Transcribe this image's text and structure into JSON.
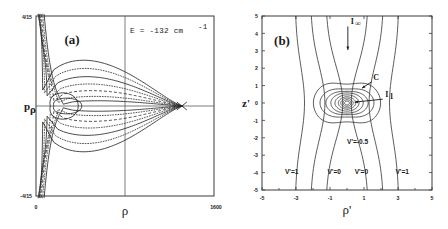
{
  "figure": {
    "caption_panels": [
      "(a)",
      "(b)"
    ],
    "background_color": "#ffffff",
    "line_color": "#2b2b2b"
  },
  "panel_a": {
    "label": "(a)",
    "annotation": {
      "text_main": "E  =  -132  cm",
      "exponent": "-1",
      "full": "E = -132 cm^-1"
    },
    "ylabel": "p",
    "ylabel_sub": "ρ",
    "xlabel": "ρ",
    "y_ticks": [
      {
        "value": 0.26667,
        "label": "4/15"
      },
      {
        "value": -0.26667,
        "label": "-4/15"
      }
    ],
    "x_ticks": [
      {
        "value": 0,
        "label": "0"
      },
      {
        "value": 1600,
        "label": "1600"
      }
    ],
    "xlim": [
      0,
      1600
    ],
    "ylim": [
      -0.26667,
      0.26667
    ],
    "crosshair": {
      "x": 800,
      "y": 0
    },
    "focus_point": {
      "x": 1320,
      "y": 0
    }
  },
  "panel_b": {
    "label": "(b)",
    "ylabel": "z'",
    "xlabel": "ρ'",
    "y_ticks": [
      5,
      4,
      3,
      2,
      1,
      0,
      -1,
      -2,
      -3,
      -4,
      -5
    ],
    "x_ticks": [
      -5,
      -3,
      -1,
      1,
      3,
      5
    ],
    "x_minor_ticks": [
      -4,
      -2,
      0,
      2,
      4
    ],
    "xlim": [
      -5,
      5
    ],
    "ylim": [
      -5,
      5
    ],
    "annotations": [
      {
        "name": "I-infinity",
        "text": "I",
        "sub": "∞",
        "x": 0.22,
        "y": 4.55
      },
      {
        "name": "contour-C",
        "text": "C",
        "sub": "",
        "x": 1.55,
        "y": 1.35
      },
      {
        "name": "I-one",
        "text": "I",
        "sub": "1",
        "x": 2.25,
        "y": 0.35
      },
      {
        "name": "potential-minus-half",
        "text": "V'=-0.5",
        "sub": "",
        "x": 0.0,
        "y": -2.35
      },
      {
        "name": "potential-left-one",
        "text": "V'=1",
        "sub": "",
        "x": -3.65,
        "y": -4.1
      },
      {
        "name": "potential-left-zero",
        "text": "V'=0",
        "sub": "",
        "x": -1.15,
        "y": -4.1
      },
      {
        "name": "potential-right-zero",
        "text": "V'=0",
        "sub": "",
        "x": 0.45,
        "y": -4.1
      },
      {
        "name": "potential-right-one",
        "text": "V'=1",
        "sub": "",
        "x": 2.85,
        "y": -4.1
      }
    ]
  },
  "chart_data": [
    {
      "type": "line",
      "name": "panel-a-poincare-contours",
      "title": "(a)",
      "subtitle": "E = -132 cm^-1",
      "xlabel": "ρ",
      "ylabel": "p_ρ",
      "xlim": [
        0,
        1600
      ],
      "ylim": [
        -0.26667,
        0.26667
      ],
      "xtick_labels": [
        "0",
        "1600"
      ],
      "ytick_labels": [
        "4/15",
        "-4/15"
      ],
      "grid": false,
      "legend": "none",
      "description": "Nested horn/funnel shaped invariant curves symmetric about p_rho = 0, opening to the left, all converging to a fixed point near rho = 1320. Alternating solid and dotted line styles.",
      "series": [
        {
          "name": "separatrix-outer",
          "style": "solid",
          "amplitude": 0.262,
          "apex_x": 1320,
          "left_x": 60
        },
        {
          "name": "curve-2",
          "style": "dotted",
          "amplitude": 0.215,
          "apex_x": 1320,
          "left_x": 78
        },
        {
          "name": "curve-3",
          "style": "solid",
          "amplitude": 0.168,
          "apex_x": 1320,
          "left_x": 100
        },
        {
          "name": "curve-4",
          "style": "dotted",
          "amplitude": 0.126,
          "apex_x": 1320,
          "left_x": 128
        },
        {
          "name": "curve-5",
          "style": "dashed",
          "amplitude": 0.088,
          "apex_x": 1320,
          "left_x": 160
        },
        {
          "name": "curve-6",
          "style": "dotted",
          "amplitude": 0.055,
          "apex_x": 1320,
          "left_x": 200
        },
        {
          "name": "curve-7",
          "style": "solid",
          "amplitude": 0.03,
          "apex_x": 1320,
          "left_x": 245
        }
      ]
    },
    {
      "type": "line",
      "name": "panel-b-potential-contours",
      "title": "(b)",
      "xlabel": "ρ'",
      "ylabel": "z'",
      "xlim": [
        -5,
        5
      ],
      "ylim": [
        -5,
        5
      ],
      "xtick_labels": [
        "-5",
        "-3",
        "-1",
        "1",
        "3",
        "5"
      ],
      "ytick_labels": [
        "5",
        "4",
        "3",
        "2",
        "1",
        "0",
        "-1",
        "-2",
        "-3",
        "-4",
        "-5"
      ],
      "grid": false,
      "legend": "none",
      "description": "Equipotential contour map in the (rho', z') plane. Six near-vertical contours span the full height (labelled V'=1 and V'=0 on each side), plus a family of nested closed ovals/peanut shapes centred on the origin, the outermost labelled V'=-0.5 with contour C and trajectories I_1 and I_infinity marked by arrows.",
      "contour_levels": [
        1.0,
        0.0,
        -0.5
      ],
      "vertical_contours": [
        {
          "level": 1.0,
          "x_at_center": -3.05,
          "bulge": 0.55
        },
        {
          "level": 0.0,
          "x_at_center": -2.15,
          "bulge": 0.85
        },
        {
          "level": 0.0,
          "x_at_center": -1.25,
          "bulge": 1.0
        },
        {
          "level": 0.0,
          "x_at_center": 1.25,
          "bulge": -1.0
        },
        {
          "level": 0.0,
          "x_at_center": 2.15,
          "bulge": -0.85
        },
        {
          "level": 1.0,
          "x_at_center": 3.05,
          "bulge": -0.55
        }
      ],
      "closed_contours": [
        {
          "level": -0.5,
          "rx": 1.62,
          "ry": 1.75,
          "waist": 0.62,
          "style": "peanut"
        },
        {
          "level": -0.55,
          "rx": 1.3,
          "ry": 1.15,
          "waist": 0.7,
          "style": "peanut"
        },
        {
          "level": -0.6,
          "rx": 1.02,
          "ry": 0.86,
          "waist": 0.78,
          "style": "oval"
        },
        {
          "level": -0.7,
          "rx": 0.78,
          "ry": 0.68,
          "waist": 0.85,
          "style": "oval"
        },
        {
          "level": -0.8,
          "rx": 0.58,
          "ry": 0.52,
          "waist": 0.9,
          "style": "oval"
        },
        {
          "level": -0.9,
          "rx": 0.42,
          "ry": 0.38,
          "waist": 0.95,
          "style": "oval"
        },
        {
          "level": -1.0,
          "rx": 0.3,
          "ry": 0.28,
          "waist": 1.0,
          "style": "circle"
        },
        {
          "level": -1.1,
          "rx": 0.2,
          "ry": 0.19,
          "waist": 1.0,
          "style": "circle"
        },
        {
          "level": -1.2,
          "rx": 0.12,
          "ry": 0.11,
          "waist": 1.0,
          "style": "circle"
        }
      ],
      "arrows": [
        {
          "name": "I-infinity",
          "from": [
            0.05,
            4.4
          ],
          "to": [
            0.05,
            3.05
          ],
          "label": "I_∞"
        },
        {
          "name": "I-one",
          "from": [
            2.1,
            0.22
          ],
          "to": [
            0.45,
            0.05
          ],
          "label": "I_1"
        },
        {
          "name": "C",
          "from": [
            1.45,
            1.22
          ],
          "to": [
            0.88,
            0.85
          ],
          "label": "C"
        }
      ]
    }
  ]
}
